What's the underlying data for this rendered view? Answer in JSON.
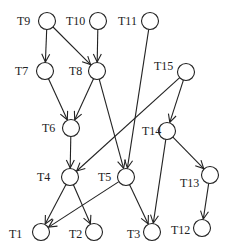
{
  "diagram": {
    "type": "task-dependency-graph",
    "node_radius": 8.5,
    "colors": {
      "stroke": "#222222",
      "background": "#ffffff"
    },
    "nodes": [
      {
        "id": "T9",
        "label": "T9",
        "x": 47,
        "y": 21,
        "label_dx": -30,
        "label_dy": 4
      },
      {
        "id": "T10",
        "label": "T10",
        "x": 98,
        "y": 21,
        "label_dx": -32,
        "label_dy": 4
      },
      {
        "id": "T11",
        "label": "T11",
        "x": 150,
        "y": 21,
        "label_dx": -32,
        "label_dy": 4
      },
      {
        "id": "T7",
        "label": "T7",
        "x": 45,
        "y": 71,
        "label_dx": -30,
        "label_dy": 4
      },
      {
        "id": "T8",
        "label": "T8",
        "x": 97,
        "y": 71,
        "label_dx": -28,
        "label_dy": 4
      },
      {
        "id": "T15",
        "label": "T15",
        "x": 186,
        "y": 72,
        "label_dx": -32,
        "label_dy": -2
      },
      {
        "id": "T6",
        "label": "T6",
        "x": 71,
        "y": 128,
        "label_dx": -29,
        "label_dy": 4
      },
      {
        "id": "T14",
        "label": "T14",
        "x": 167,
        "y": 131,
        "label_dx": -25,
        "label_dy": 4
      },
      {
        "id": "T4",
        "label": "T4",
        "x": 70,
        "y": 177,
        "label_dx": -33,
        "label_dy": 4
      },
      {
        "id": "T5",
        "label": "T5",
        "x": 126,
        "y": 177,
        "label_dx": -28,
        "label_dy": 4
      },
      {
        "id": "T13",
        "label": "T13",
        "x": 210,
        "y": 175,
        "label_dx": -30,
        "label_dy": 12
      },
      {
        "id": "T1",
        "label": "T1",
        "x": 41,
        "y": 232,
        "label_dx": -32,
        "label_dy": 6
      },
      {
        "id": "T2",
        "label": "T2",
        "x": 94,
        "y": 232,
        "label_dx": -25,
        "label_dy": 6
      },
      {
        "id": "T3",
        "label": "T3",
        "x": 152,
        "y": 232,
        "label_dx": -25,
        "label_dy": 6
      },
      {
        "id": "T12",
        "label": "T12",
        "x": 202,
        "y": 228,
        "label_dx": -31,
        "label_dy": 6
      }
    ],
    "edges": [
      {
        "from": "T9",
        "to": "T7"
      },
      {
        "from": "T9",
        "to": "T8"
      },
      {
        "from": "T10",
        "to": "T8"
      },
      {
        "from": "T7",
        "to": "T6"
      },
      {
        "from": "T8",
        "to": "T6"
      },
      {
        "from": "T8",
        "to": "T5"
      },
      {
        "from": "T11",
        "to": "T5"
      },
      {
        "from": "T15",
        "to": "T4"
      },
      {
        "from": "T15",
        "to": "T14"
      },
      {
        "from": "T6",
        "to": "T4"
      },
      {
        "from": "T4",
        "to": "T1"
      },
      {
        "from": "T4",
        "to": "T2"
      },
      {
        "from": "T5",
        "to": "T1"
      },
      {
        "from": "T5",
        "to": "T3"
      },
      {
        "from": "T14",
        "to": "T3"
      },
      {
        "from": "T14",
        "to": "T13"
      },
      {
        "from": "T13",
        "to": "T12"
      }
    ]
  }
}
